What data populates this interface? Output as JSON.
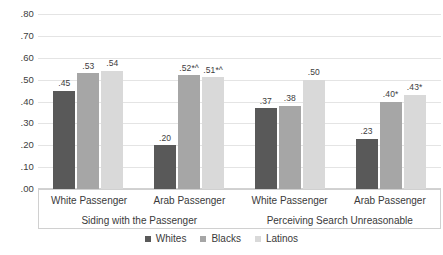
{
  "chart_data": {
    "type": "bar",
    "title": "",
    "xlabel": "",
    "ylabel": "",
    "ylim": [
      0.0,
      0.8
    ],
    "ytick_labels": [
      ".80",
      ".70",
      ".60",
      ".50",
      ".40",
      ".30",
      ".20",
      ".10",
      ".00"
    ],
    "ytick_values": [
      0.8,
      0.7,
      0.6,
      0.5,
      0.4,
      0.3,
      0.2,
      0.1,
      0.0
    ],
    "grid": true,
    "legend_position": "bottom-center",
    "categories": [
      "White Passenger",
      "Arab Passenger",
      "White Passenger",
      "Arab Passenger"
    ],
    "super_categories": [
      "Siding with the Passenger",
      "Perceiving Search Unreasonable"
    ],
    "series": [
      {
        "name": "Whites",
        "color": "#595959",
        "values": [
          0.45,
          0.2,
          0.37,
          0.23
        ],
        "labels": [
          ".45",
          ".20",
          ".37",
          ".23"
        ]
      },
      {
        "name": "Blacks",
        "color": "#a6a6a6",
        "values": [
          0.53,
          0.52,
          0.38,
          0.4
        ],
        "labels": [
          ".53",
          ".52*^",
          ".38",
          ".40*"
        ]
      },
      {
        "name": "Latinos",
        "color": "#d9d9d9",
        "values": [
          0.54,
          0.51,
          0.5,
          0.43
        ],
        "labels": [
          ".54",
          ".51*^",
          ".50",
          ".43*"
        ]
      }
    ]
  }
}
